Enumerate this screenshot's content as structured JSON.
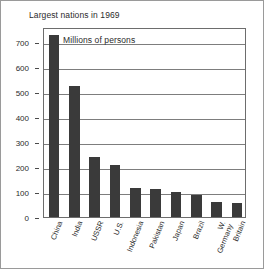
{
  "chart_data": {
    "type": "bar",
    "title": "Largest nations in 1969",
    "subtitle": "Millions of persons",
    "xlabel": "",
    "ylabel": "",
    "categories": [
      "China",
      "India",
      "USSR",
      "U.S.",
      "Indonesia",
      "Pakistan",
      "Japan",
      "Brazil",
      "W.\nGermany",
      "Britain"
    ],
    "values": [
      730,
      525,
      240,
      210,
      115,
      112,
      102,
      90,
      60,
      55
    ],
    "ylim": [
      0,
      760
    ],
    "yticks": [
      0,
      100,
      200,
      300,
      400,
      500,
      600,
      700
    ],
    "ytick_labels": [
      "0",
      "100",
      "200",
      "300",
      "400",
      "500",
      "600",
      "700"
    ],
    "grid": true,
    "legend": false,
    "bar_color": "#3a3a3a",
    "grid_color": "#7d7d7d",
    "frame_color": "#6d6d6d",
    "background_color": "#ffffff",
    "text_color": "#2b2b2b"
  }
}
